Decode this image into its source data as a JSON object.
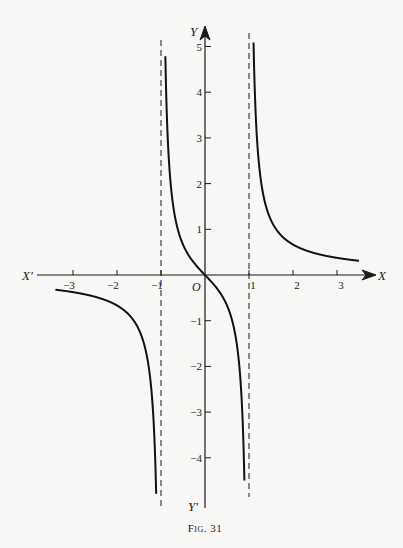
{
  "figure": {
    "caption": "Fig. 31"
  },
  "axes": {
    "x_label": "X",
    "x_neg_label": "X′",
    "y_label": "Y",
    "y_neg_label": "Y′",
    "origin_label": "O"
  },
  "colors": {
    "ink": "#1a1a1a",
    "paper": "#f7f7f5"
  },
  "chart_data": {
    "type": "line",
    "title": "",
    "caption": "Fig. 31",
    "function": "y = x/(x^2 - 1)",
    "xlabel": "X",
    "ylabel": "Y",
    "xlim": [
      -3.4,
      3.4
    ],
    "ylim": [
      -5,
      5.3
    ],
    "grid": false,
    "legend": null,
    "x_ticks": [
      -3,
      -2,
      -1,
      1,
      2,
      3
    ],
    "x_tick_labels": [
      "−3",
      "−2",
      "−1",
      "1",
      "2",
      "3"
    ],
    "y_ticks": [
      5,
      4,
      3,
      2,
      1,
      -1,
      -2,
      -3,
      -4
    ],
    "y_tick_labels": [
      "5",
      "4",
      "3",
      "2",
      "1",
      "−1",
      "−2",
      "−3",
      "−4"
    ],
    "asymptotes": [
      {
        "type": "vertical",
        "x": -1,
        "style": "dashed"
      },
      {
        "type": "vertical",
        "x": 1,
        "style": "dashed"
      }
    ],
    "series": [
      {
        "name": "left branch (x < -1)",
        "x": [
          -3.4,
          -3,
          -2.5,
          -2,
          -1.5,
          -1.25,
          -1.1,
          -1.05
        ],
        "y": [
          -0.32,
          -0.375,
          -0.476,
          -0.667,
          -1.2,
          -2.22,
          -5.24,
          -4.9
        ]
      },
      {
        "name": "middle branch (-1 < x < 1)",
        "x": [
          -0.9,
          -0.8,
          -0.6,
          -0.4,
          -0.2,
          0,
          0.2,
          0.4,
          0.6,
          0.8,
          0.9
        ],
        "y": [
          4.74,
          2.22,
          0.94,
          0.48,
          0.21,
          0,
          -0.21,
          -0.48,
          -0.94,
          -2.22,
          -4.74
        ]
      },
      {
        "name": "right branch (x > 1)",
        "x": [
          1.05,
          1.1,
          1.25,
          1.5,
          2,
          2.5,
          3,
          3.4
        ],
        "y": [
          5.12,
          5.24,
          2.22,
          1.2,
          0.667,
          0.476,
          0.375,
          0.32
        ]
      }
    ]
  }
}
